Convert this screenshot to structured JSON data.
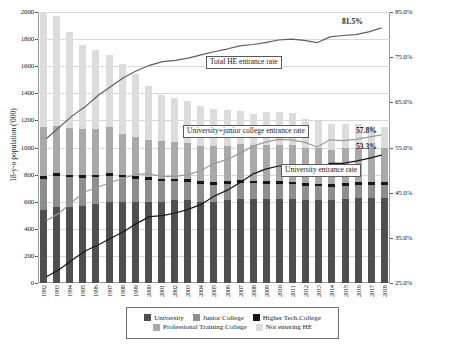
{
  "chart_data": {
    "type": "bar",
    "title": "",
    "subtitle": "",
    "xlabel": "",
    "ylabel": "18-y-o population ('000)",
    "ylabel_right": "",
    "ylim": [
      0,
      2000
    ],
    "ylim_right": [
      25.0,
      85.0
    ],
    "grid": true,
    "legend_position": "bottom",
    "categories": [
      "1992",
      "1993",
      "1994",
      "1995",
      "1996",
      "1997",
      "1998",
      "1999",
      "2000",
      "2001",
      "2002",
      "2003",
      "2004",
      "2005",
      "2006",
      "2007",
      "2008",
      "2009",
      "2010",
      "2011",
      "2012",
      "2013",
      "2014",
      "2015",
      "2016",
      "2017",
      "2018"
    ],
    "y_ticks": [
      0,
      200,
      400,
      600,
      800,
      1000,
      1200,
      1400,
      1600,
      1800,
      2000
    ],
    "y_tick_labels": [
      "0",
      "200",
      "400",
      "600",
      "800",
      "1000",
      "1200",
      "1400",
      "1600",
      "1800",
      "2000"
    ],
    "y_right_ticks": [
      25.0,
      35.0,
      45.0,
      55.0,
      65.0,
      75.0,
      85.0
    ],
    "y_right_tick_labels": [
      "25.0%",
      "35.0%",
      "45.0%",
      "55.0%",
      "65.0%",
      "75.0%",
      "85.0%"
    ],
    "stacked": true,
    "series": [
      {
        "name": "University",
        "color": "#4f4f4f",
        "values": [
          540,
          560,
          560,
          565,
          580,
          600,
          600,
          600,
          600,
          600,
          610,
          610,
          600,
          600,
          610,
          620,
          620,
          620,
          620,
          620,
          610,
          610,
          610,
          620,
          630,
          630,
          630
        ]
      },
      {
        "name": "Junior College",
        "color": "#8e8e8e",
        "values": [
          230,
          230,
          220,
          210,
          200,
          190,
          180,
          170,
          160,
          150,
          140,
          135,
          130,
          125,
          120,
          118,
          115,
          112,
          110,
          108,
          105,
          103,
          100,
          98,
          96,
          95,
          93
        ]
      },
      {
        "name": "Higher Tech.College",
        "color": "#161616",
        "values": [
          20,
          20,
          20,
          20,
          20,
          20,
          20,
          20,
          20,
          20,
          20,
          20,
          20,
          20,
          20,
          20,
          20,
          20,
          20,
          20,
          20,
          20,
          20,
          20,
          20,
          20,
          20
        ]
      },
      {
        "name": "Professional Training College",
        "color": "#a9a9a9",
        "values": [
          360,
          350,
          345,
          345,
          340,
          340,
          300,
          290,
          275,
          275,
          270,
          270,
          260,
          265,
          265,
          265,
          265,
          270,
          270,
          270,
          265,
          260,
          255,
          255,
          250,
          250,
          250
        ]
      },
      {
        "name": "Not entering HE",
        "color": "#dcdcdc",
        "values": [
          850,
          810,
          705,
          620,
          580,
          530,
          515,
          465,
          400,
          345,
          325,
          310,
          300,
          275,
          265,
          245,
          230,
          240,
          245,
          235,
          210,
          205,
          190,
          180,
          175,
          165,
          155
        ]
      }
    ],
    "lines": [
      {
        "name": "Total HE entrance rate",
        "color": "#5f5f5f",
        "axis": "right",
        "values": [
          57.0,
          59.5,
          62.0,
          64.0,
          66.5,
          68.5,
          70.5,
          72.0,
          73.2,
          74.0,
          74.3,
          74.8,
          75.5,
          76.2,
          76.8,
          77.5,
          77.8,
          78.2,
          78.8,
          79.0,
          78.7,
          78.2,
          79.5,
          79.8,
          80.0,
          80.6,
          81.5
        ],
        "end_label": "81.5%"
      },
      {
        "name": "University+junior college entrance rate",
        "color": "#9a9a9a",
        "axis": "right",
        "values": [
          38.8,
          40.5,
          43.0,
          45.2,
          46.2,
          47.3,
          48.2,
          49.1,
          49.1,
          48.6,
          48.6,
          49.0,
          49.9,
          51.5,
          52.3,
          53.7,
          55.3,
          56.2,
          56.8,
          56.7,
          56.2,
          55.1,
          56.7,
          56.5,
          56.8,
          57.3,
          57.8
        ],
        "end_label": "57.8%"
      },
      {
        "name": "University entrance rate",
        "color": "#161616",
        "axis": "right",
        "values": [
          26.4,
          28.0,
          30.1,
          32.1,
          33.4,
          34.9,
          36.4,
          38.2,
          39.7,
          39.9,
          40.5,
          41.3,
          42.4,
          44.2,
          45.5,
          47.2,
          49.1,
          50.2,
          50.9,
          51.0,
          50.8,
          49.9,
          51.5,
          51.5,
          52.0,
          52.6,
          53.3
        ],
        "end_label": "53.3%"
      }
    ],
    "annotations": [
      {
        "id": "callout-total-he",
        "text": "Total HE entrance rate"
      },
      {
        "id": "callout-univ-jc",
        "text": "University+junior college entrance rate"
      },
      {
        "id": "callout-univ",
        "text": "University entrance rate"
      }
    ],
    "value_labels": [
      {
        "id": "label-total-he",
        "text": "81.5%"
      },
      {
        "id": "label-univ-jc",
        "text": "57.8%"
      },
      {
        "id": "label-univ",
        "text": "53.3%"
      }
    ]
  },
  "legend": {
    "row1": [
      {
        "label": "University",
        "color": "#4f4f4f"
      },
      {
        "label": "Junior College",
        "color": "#8e8e8e"
      },
      {
        "label": "Higher Tech.College",
        "color": "#161616"
      }
    ],
    "row2": [
      {
        "label": "Professional Training College",
        "color": "#a9a9a9"
      },
      {
        "label": "Not entering HE",
        "color": "#dcdcdc"
      }
    ]
  }
}
